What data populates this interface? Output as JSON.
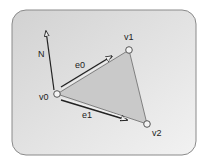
{
  "diagram": {
    "type": "triangle-vectors",
    "frame": {
      "x": 12,
      "y": 10,
      "w": 184,
      "h": 145,
      "rx": 14,
      "fill_light": "#f2f2f2",
      "fill_dark": "#d2d2d2",
      "stroke": "#8a8a8a"
    },
    "triangle": {
      "fill": "#c9c9c9",
      "stroke": "#6a6a6a"
    },
    "vertices": [
      {
        "id": "v0",
        "label": "v0",
        "x": 57,
        "y": 94,
        "label_x": 39,
        "label_y": 100
      },
      {
        "id": "v1",
        "label": "v1",
        "x": 129,
        "y": 50,
        "label_x": 124,
        "label_y": 40
      },
      {
        "id": "v2",
        "label": "v2",
        "x": 147,
        "y": 124,
        "label_x": 152,
        "label_y": 136
      }
    ],
    "vectors": [
      {
        "id": "N",
        "label": "N",
        "x1": 54,
        "y1": 90,
        "x2": 46,
        "y2": 31,
        "label_x": 38,
        "label_y": 57
      },
      {
        "id": "e0",
        "label": "e0",
        "x1": 61,
        "y1": 87,
        "x2": 112,
        "y2": 56,
        "label_x": 75,
        "label_y": 68
      },
      {
        "id": "e1",
        "label": "e1",
        "x1": 61,
        "y1": 100,
        "x2": 127,
        "y2": 120,
        "label_x": 82,
        "label_y": 118
      }
    ],
    "colors": {
      "vector": "#222222",
      "vertex_fill": "#f4f4f4",
      "vertex_stroke": "#555555"
    }
  }
}
